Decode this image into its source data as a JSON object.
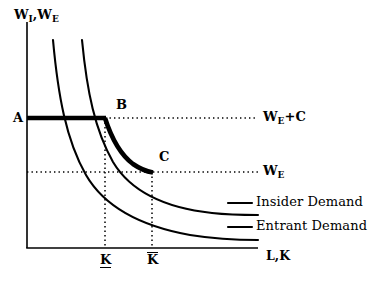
{
  "figure": {
    "axes": {
      "y_axis_label": "W",
      "y_axis_label_sub1": "I",
      "y_axis_label_mid": ",W",
      "y_axis_label_sub2": "E",
      "y_axis_label_full": "W_I,W_E",
      "x_axis_label": "L,K",
      "origin_x": 27,
      "origin_y": 248,
      "x_axis_end": 258,
      "y_axis_top": 22
    },
    "points": [
      {
        "name": "A",
        "label": "A",
        "x": 17,
        "y": 118
      },
      {
        "name": "B",
        "label": "B",
        "x": 119,
        "y": 105
      },
      {
        "name": "C",
        "label": "C",
        "x": 162,
        "y": 157
      }
    ],
    "wage_lines": [
      {
        "name": "wage-entrant-plus-cost",
        "label": "W",
        "label_sub": "E",
        "label_suffix": "+C",
        "label_full": "W_E+C",
        "y": 118,
        "x_start": 105,
        "x_end": 258,
        "label_x": 263,
        "label_y": 111
      },
      {
        "name": "wage-entrant",
        "label": "W",
        "label_sub": "E",
        "label_suffix": "",
        "label_full": "W_E",
        "y": 172,
        "x_start": 27,
        "x_end": 258,
        "label_x": 263,
        "label_y": 165
      }
    ],
    "quantity_ticks": [
      {
        "name": "k-lower-bar",
        "label": "K",
        "bar": "under",
        "x": 105,
        "label_x": 100,
        "label_y": 255
      },
      {
        "name": "k-upper-bar",
        "label": "K",
        "bar": "over",
        "x": 152,
        "label_x": 147,
        "label_y": 255
      }
    ],
    "curves": [
      {
        "name": "insider-demand",
        "label": "Insider Demand",
        "label_x": 256,
        "label_y": 196,
        "leader_x1": 228,
        "leader_x2": 252,
        "leader_y": 203
      },
      {
        "name": "entrant-demand",
        "label": "Entrant Demand",
        "label_x": 256,
        "label_y": 220,
        "leader_x1": 228,
        "leader_x2": 252,
        "leader_y": 227
      }
    ],
    "highlighted_path": {
      "name": "effective-labour-cost-schedule",
      "description": "bold segment A-B then bold along insider demand B-C"
    },
    "colors": {
      "ink": "#000000",
      "background": "#ffffff",
      "dotted": "#000000"
    }
  }
}
